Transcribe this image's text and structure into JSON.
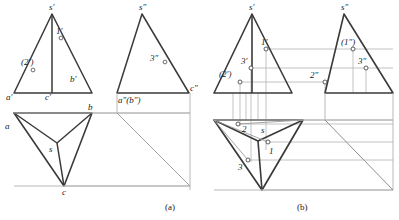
{
  "figure": {
    "kind": "orthographic-projection-drawing",
    "captions": [
      {
        "id": "cap-a",
        "text": "(a)",
        "x": 165,
        "y": 203
      },
      {
        "id": "cap-b",
        "text": "(b)",
        "x": 297,
        "y": 203
      }
    ],
    "colors": {
      "object_line": "#3a3a3a",
      "thin_line": "#9a9a9a",
      "projection_line": "#a8a8a8",
      "text": "#1a1a1a",
      "background": "#ffffff"
    }
  },
  "panel_a": {
    "name": "given-views",
    "front_view": {
      "name": "front-view-a",
      "apex": {
        "label": "s′",
        "x": 78,
        "y": 5
      },
      "base_left": {
        "label": "a′",
        "x": 7,
        "y": 93
      },
      "base_mid": {
        "label": "c′",
        "x": 42,
        "y": 93
      },
      "base_right": {
        "label": "b′",
        "x": 66,
        "y": 78
      },
      "points": [
        {
          "label": "1′",
          "x": 57,
          "y": 28,
          "mark_x": 61,
          "mark_y": 38
        },
        {
          "label": "(2′)",
          "x": 22,
          "y": 57,
          "mark_x": 33,
          "mark_y": 70
        }
      ]
    },
    "side_view": {
      "name": "side-view-a",
      "apex": {
        "label": "s″",
        "x": 148,
        "y": 5
      },
      "base_left": {
        "label": "a″(b″)",
        "x": 117,
        "y": 95
      },
      "base_right": {
        "label": "c″",
        "x": 188,
        "y": 85
      },
      "points": [
        {
          "label": "3″",
          "x": 149,
          "y": 54,
          "mark_x": 165,
          "mark_y": 62
        }
      ]
    },
    "top_view": {
      "name": "top-view-a",
      "vertex_a": {
        "label": "a",
        "x": 8,
        "y": 124
      },
      "vertex_b": {
        "label": "b",
        "x": 89,
        "y": 106
      },
      "vertex_c": {
        "label": "c",
        "x": 62,
        "y": 192
      },
      "interior": {
        "label": "s",
        "x": 49,
        "y": 146
      }
    }
  },
  "panel_b": {
    "name": "solution-views",
    "front_view": {
      "name": "front-view-b",
      "apex": {
        "label": "s′",
        "x": 252,
        "y": 5
      },
      "points": [
        {
          "label": "1′",
          "x": 258,
          "y": 38,
          "mark_x": 266,
          "mark_y": 49
        },
        {
          "label": "3′",
          "x": 238,
          "y": 58,
          "mark_x": 251,
          "mark_y": 68
        },
        {
          "label": "(2′)",
          "x": 222,
          "y": 70,
          "mark_x": 240,
          "mark_y": 82
        }
      ]
    },
    "side_view": {
      "name": "side-view-b",
      "apex": {
        "label": "s″",
        "x": 344,
        "y": 5
      },
      "points": [
        {
          "label": "(1″)",
          "x": 340,
          "y": 38,
          "mark_x": 353,
          "mark_y": 49
        },
        {
          "label": "3″",
          "x": 357,
          "y": 58,
          "mark_x": 366,
          "mark_y": 68
        },
        {
          "label": "2″",
          "x": 312,
          "y": 72,
          "mark_x": 325,
          "mark_y": 82
        }
      ]
    },
    "top_view": {
      "name": "top-view-b",
      "interior": {
        "label": "s",
        "x": 260,
        "y": 127
      },
      "points": [
        {
          "label": "2",
          "x": 243,
          "y": 128,
          "mark_x": 238,
          "mark_y": 124
        },
        {
          "label": "1",
          "x": 272,
          "y": 151,
          "mark_x": 268,
          "mark_y": 142
        },
        {
          "label": "3",
          "x": 240,
          "y": 166,
          "mark_x": 248,
          "mark_y": 160
        }
      ]
    }
  }
}
